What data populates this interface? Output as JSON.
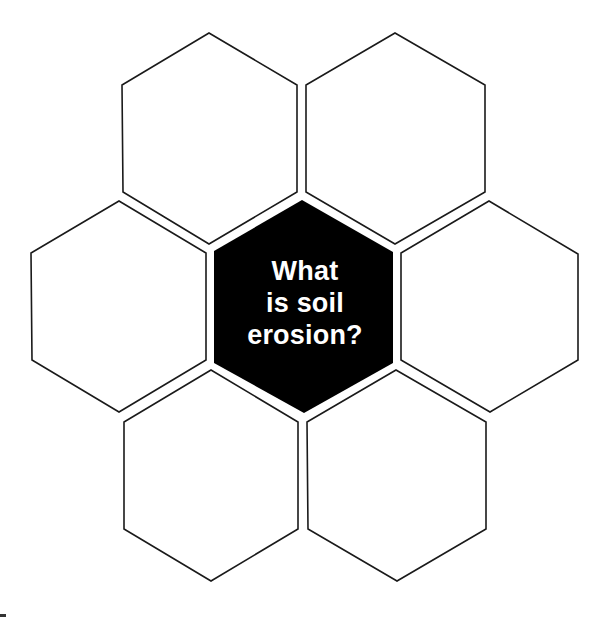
{
  "diagram": {
    "type": "hexagon-thinking-map",
    "center": {
      "lines": [
        "What",
        "is soil",
        "erosion?"
      ],
      "fill_color": "#000000",
      "text_color": "#ffffff"
    },
    "cells": [
      {
        "id": "top-left",
        "text": ""
      },
      {
        "id": "top-right",
        "text": ""
      },
      {
        "id": "left",
        "text": ""
      },
      {
        "id": "right",
        "text": ""
      },
      {
        "id": "bottom-left",
        "text": ""
      },
      {
        "id": "bottom-right",
        "text": ""
      }
    ],
    "outline_color": "#1a1a1a",
    "background_color": "#ffffff"
  }
}
